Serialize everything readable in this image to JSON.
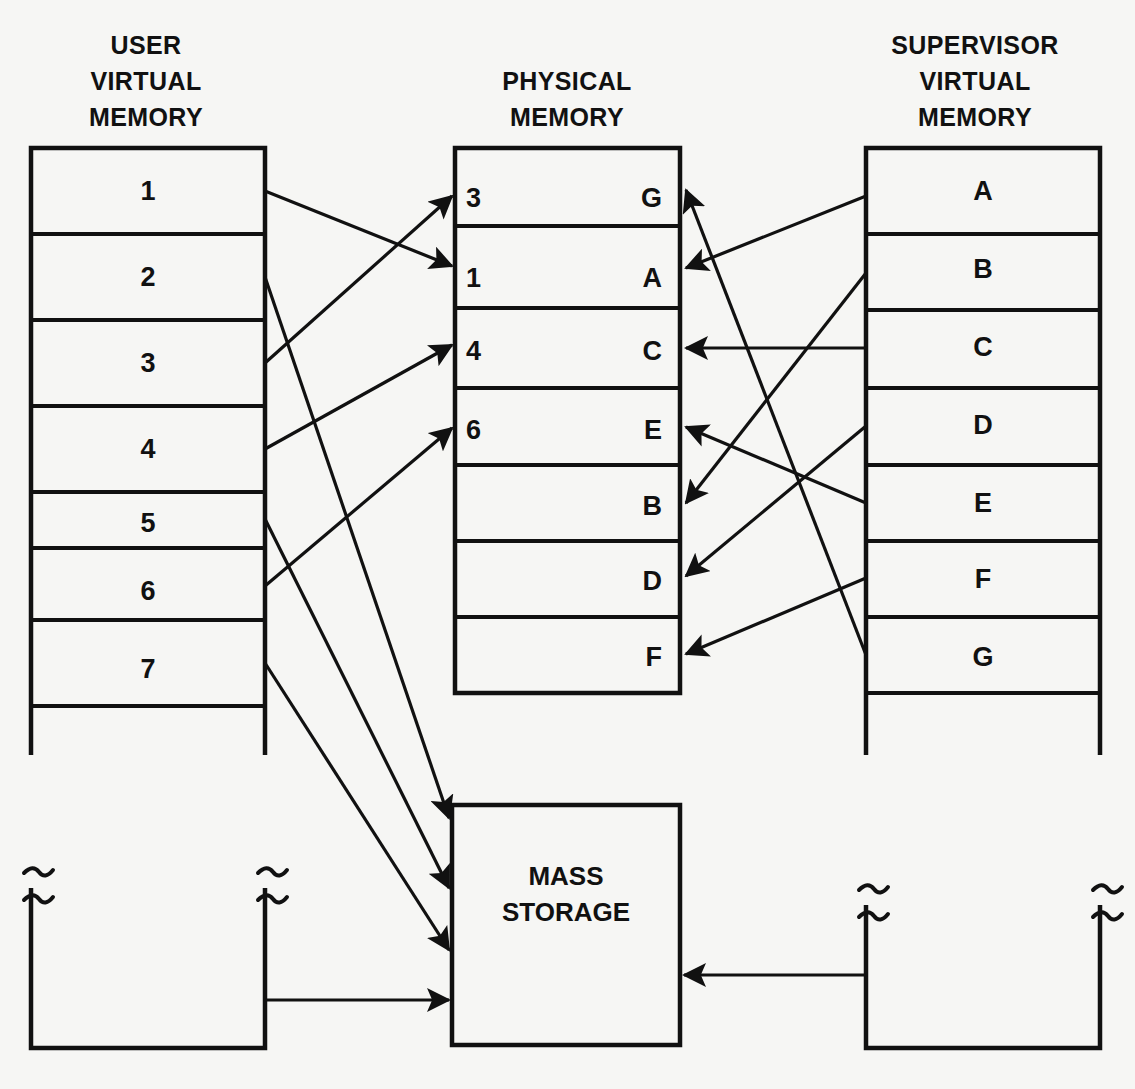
{
  "diagram": {
    "mass_storage": {
      "line1": "MASS",
      "line2": "STORAGE"
    }
  },
  "columns": {
    "user": {
      "header": [
        "USER",
        "VIRTUAL",
        "MEMORY"
      ],
      "rows": [
        "1",
        "2",
        "3",
        "4",
        "5",
        "6",
        "7"
      ]
    },
    "physical": {
      "header": [
        "PHYSICAL",
        "MEMORY"
      ],
      "left_labels": [
        "3",
        "1",
        "4",
        "6",
        "",
        "",
        ""
      ],
      "right_labels": [
        "G",
        "A",
        "C",
        "E",
        "B",
        "D",
        "F"
      ]
    },
    "supervisor": {
      "header": [
        "SUPERVISOR",
        "VIRTUAL",
        "MEMORY"
      ],
      "rows": [
        "A",
        "B",
        "C",
        "D",
        "E",
        "F",
        "G"
      ]
    }
  },
  "mappings": {
    "user_to_physical": [
      {
        "from": "1",
        "to": "1"
      },
      {
        "from": "2",
        "to": "6"
      },
      {
        "from": "3",
        "to": "3"
      },
      {
        "from": "4",
        "to": "4"
      }
    ],
    "user_to_mass_storage": [
      "4",
      "5",
      "6",
      "7"
    ],
    "supervisor_to_physical": [
      {
        "from": "A",
        "to": "A"
      },
      {
        "from": "B",
        "to": "B"
      },
      {
        "from": "C",
        "to": "C"
      },
      {
        "from": "D",
        "to": "D"
      },
      {
        "from": "E",
        "to": "E"
      },
      {
        "from": "F",
        "to": "F"
      },
      {
        "from": "G",
        "to": "G"
      }
    ],
    "supervisor_to_mass_storage": 1
  },
  "colors": {
    "ink": "#111111",
    "paper": "#f6f6f4"
  }
}
